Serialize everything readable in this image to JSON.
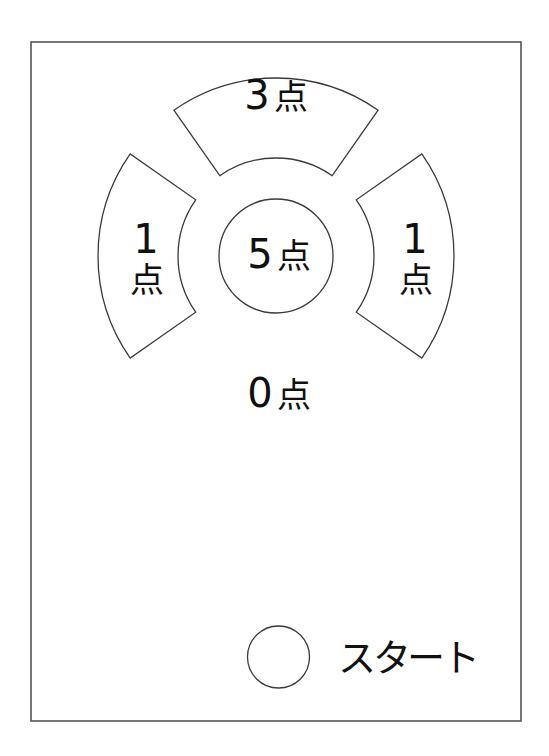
{
  "board": {
    "zones": {
      "top": {
        "points": "3点",
        "digit": "3",
        "unit": "点"
      },
      "left": {
        "points": "1点",
        "digit": "1",
        "unit": "点"
      },
      "right": {
        "points": "1点",
        "digit": "1",
        "unit": "点"
      },
      "center": {
        "points": "5点",
        "digit": "5",
        "unit": "点"
      },
      "outside": {
        "points": "0点",
        "digit": "0",
        "unit": "点"
      }
    },
    "start": {
      "label": "スタート"
    }
  },
  "colors": {
    "line": "#3a3a3a",
    "background": "#ffffff",
    "text": "#111111"
  }
}
